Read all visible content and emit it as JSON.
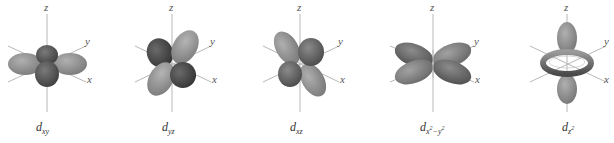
{
  "figure": {
    "background": "#ffffff",
    "colors": {
      "axis": "#b8b8b8",
      "lobe_dark": "#555555",
      "lobe_light": "#959595",
      "label": "#333333"
    },
    "axis_labels": {
      "z": "z",
      "y": "y",
      "x": "x"
    },
    "orbitals": [
      {
        "id": "dxy",
        "main": "d",
        "sub": "xy",
        "sup": "",
        "center_x": 47
      },
      {
        "id": "dyz",
        "main": "d",
        "sub": "yz",
        "sup": "",
        "center_x": 172
      },
      {
        "id": "dxz",
        "main": "d",
        "sub": "xz",
        "sup": "",
        "center_x": 300
      },
      {
        "id": "dx2y2",
        "main": "d",
        "sub": "x",
        "sub_sup": "2",
        "sub_mid": "−y",
        "sub_sup2": "2",
        "center_x": 433
      },
      {
        "id": "dz2",
        "main": "d",
        "sub": "z",
        "sub_sup": "2",
        "center_x": 567
      }
    ]
  }
}
